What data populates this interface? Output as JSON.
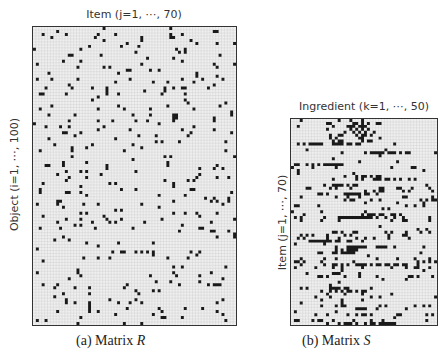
{
  "figure": {
    "panel_a": {
      "top_label": "Item (j=1, ⋯, 70)",
      "side_label": "Object (i=1, ⋯, 100)",
      "caption_prefix": "(a) Matrix ",
      "caption_var": "R",
      "rows": 100,
      "cols": 70,
      "density": 0.05,
      "seed": 17
    },
    "panel_b": {
      "top_label": "Ingredient (k=1, ⋯, 50)",
      "side_label": "Item (j=1, ⋯, 70)",
      "caption_prefix": "(b) Matrix ",
      "caption_var": "S",
      "rows": 70,
      "cols": 50,
      "density": 0.12,
      "seed": 41
    },
    "colors": {
      "filled_cell": "#1a1a1a",
      "empty_cell": "#efefef",
      "grid_line": "#c8c8c8",
      "border": "#333333"
    }
  }
}
